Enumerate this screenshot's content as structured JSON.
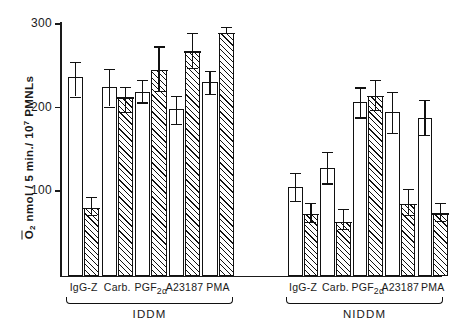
{
  "chart_data": {
    "type": "bar",
    "title": "",
    "xlabel": "",
    "ylabel": "O2- nmol / 5 min./ 10^7 PMNLs",
    "ylabel_parts": {
      "species": "O",
      "species_sub": "2",
      "species_sup": "–",
      "rest": " nmol / 5 min./ 10",
      "exp": "7",
      "tail": " PMNLs"
    },
    "ylim": [
      0,
      310
    ],
    "yticks": [
      100,
      200,
      300
    ],
    "ytick_labels": [
      "100",
      "200",
      "300"
    ],
    "grid": false,
    "legend": null,
    "categories": [
      "IgG-Z",
      "Carb.",
      "PGF2α",
      "A23187",
      "PMA"
    ],
    "category_labels_html": [
      "IgG-Z",
      "Carb.",
      "PGF<sub>2α</sub>",
      "A23187",
      "PMA"
    ],
    "groups": [
      {
        "name": "IDDM",
        "label": "IDDM",
        "bars": [
          {
            "category": "IgG-Z",
            "fill": "open",
            "value": 235,
            "err_high": 253,
            "err_low": 212
          },
          {
            "category": "IgG-Z",
            "fill": "hatched",
            "value": 79,
            "err_high": 92,
            "err_low": 70
          },
          {
            "category": "Carb.",
            "fill": "open",
            "value": 224,
            "err_high": 245,
            "err_low": 200
          },
          {
            "category": "Carb.",
            "fill": "hatched",
            "value": 211,
            "err_high": 224,
            "err_low": 194
          },
          {
            "category": "PGF2α",
            "fill": "open",
            "value": 217,
            "err_high": 232,
            "err_low": 205
          },
          {
            "category": "PGF2α",
            "fill": "hatched",
            "value": 244,
            "err_high": 272,
            "err_low": 219
          },
          {
            "category": "A23187",
            "fill": "open",
            "value": 197,
            "err_high": 213,
            "err_low": 179
          },
          {
            "category": "A23187",
            "fill": "hatched",
            "value": 266,
            "err_high": 288,
            "err_low": 246
          },
          {
            "category": "PMA",
            "fill": "open",
            "value": 229,
            "err_high": 243,
            "err_low": 215
          },
          {
            "category": "PMA",
            "fill": "hatched",
            "value": 288,
            "err_high": 295,
            "err_low": 288
          }
        ]
      },
      {
        "name": "NIDDM",
        "label": "NIDDM",
        "bars": [
          {
            "category": "IgG-Z",
            "fill": "open",
            "value": 104,
            "err_high": 121,
            "err_low": 87
          },
          {
            "category": "IgG-Z",
            "fill": "hatched",
            "value": 71,
            "err_high": 85,
            "err_low": 62
          },
          {
            "category": "Carb.",
            "fill": "open",
            "value": 127,
            "err_high": 146,
            "err_low": 108
          },
          {
            "category": "Carb.",
            "fill": "hatched",
            "value": 62,
            "err_high": 77,
            "err_low": 53
          },
          {
            "category": "PGF2α",
            "fill": "open",
            "value": 205,
            "err_high": 223,
            "err_low": 187
          },
          {
            "category": "PGF2α",
            "fill": "hatched",
            "value": 213,
            "err_high": 232,
            "err_low": 196
          },
          {
            "category": "A23187",
            "fill": "open",
            "value": 194,
            "err_high": 218,
            "err_low": 168
          },
          {
            "category": "A23187",
            "fill": "hatched",
            "value": 83,
            "err_high": 101,
            "err_low": 70
          },
          {
            "category": "PMA",
            "fill": "open",
            "value": 186,
            "err_high": 208,
            "err_low": 166
          },
          {
            "category": "PMA",
            "fill": "hatched",
            "value": 72,
            "err_high": 85,
            "err_low": 63
          }
        ]
      }
    ],
    "fill_styles": {
      "open": "white / unfilled",
      "hatched": "diagonal hatching"
    },
    "colors": {
      "ink": "#111111",
      "background": "#ffffff"
    }
  }
}
